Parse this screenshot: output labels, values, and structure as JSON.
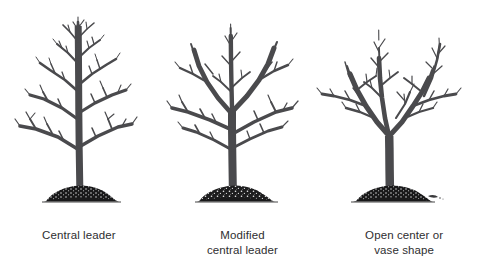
{
  "figure": {
    "name": "fruit-tree-training-systems-diagram",
    "background_color": "#ffffff",
    "width": 483,
    "height": 278,
    "line_color": "#4a4a4d",
    "soil_color": "#19191a",
    "text_color": "#2e2e30"
  },
  "panels": [
    {
      "id": "central-leader",
      "caption": "Central leader",
      "icon": "bare-tree-central-leader-icon",
      "center_x": 80,
      "description": "Single dominant upright trunk running full height with tiers of lateral branches"
    },
    {
      "id": "modified-central-leader",
      "caption": "Modified\ncentral leader",
      "icon": "bare-tree-modified-central-leader-icon",
      "center_x": 233,
      "description": "Trunk rises then divides into several co-dominant scaffold limbs in the upper canopy"
    },
    {
      "id": "open-center-vase",
      "caption": "Open center or\nvase shape",
      "icon": "bare-tree-open-center-vase-icon",
      "center_x": 390,
      "description": "Short trunk splitting low into a V of outward scaffold limbs leaving the center open"
    }
  ],
  "ground": {
    "label": "soil mound",
    "icon": "soil-mound-icon",
    "baseline_y": 200
  }
}
